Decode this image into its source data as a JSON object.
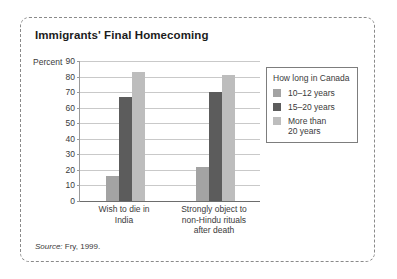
{
  "figure": {
    "title": "Immigrants' Final Homecoming",
    "source_prefix": "Source:",
    "source_text": " Fry, 1999."
  },
  "legend": {
    "title": "How long in Canada",
    "items": [
      {
        "label": "10–12 years",
        "color": "#a3a3a3"
      },
      {
        "label": "15–20 years",
        "color": "#5c5c5c"
      },
      {
        "label": "More than\n20 years",
        "color": "#bdbdbd"
      }
    ]
  },
  "chart_data": {
    "type": "bar",
    "title": "Immigrants' Final Homecoming",
    "xlabel": "",
    "ylabel": "Percent",
    "ylim": [
      0,
      90
    ],
    "ytick_step": 10,
    "yticks": [
      0,
      10,
      20,
      30,
      40,
      50,
      60,
      70,
      80,
      90
    ],
    "grid": true,
    "legend_position": "right",
    "legend_title": "How long in Canada",
    "categories": [
      "Wish to die in\nIndia",
      "Strongly object to\nnon-Hindu rituals\nafter death"
    ],
    "series": [
      {
        "name": "10–12 years",
        "color": "#a3a3a3",
        "values": [
          16,
          22
        ]
      },
      {
        "name": "15–20 years",
        "color": "#5c5c5c",
        "values": [
          67,
          70
        ]
      },
      {
        "name": "More than 20 years",
        "color": "#bdbdbd",
        "values": [
          83,
          81
        ]
      }
    ],
    "source": "Source: Fry, 1999."
  }
}
